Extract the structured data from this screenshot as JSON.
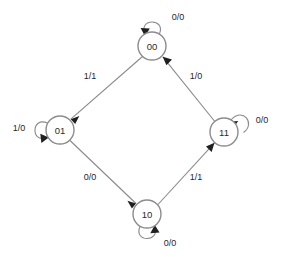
{
  "diagram": {
    "type": "finite-state-machine",
    "label_format": "input/output",
    "colors": {
      "background": "#ffffff",
      "node_stroke": "#8c8c8c",
      "node_fill": "#ffffff",
      "edge_stroke": "#8a8a8a",
      "arrow_fill": "#1f1f1f",
      "text": "#1f1f1f"
    },
    "states": [
      {
        "id": "s00",
        "label": "00",
        "cx": 152,
        "cy": 46,
        "r": 14
      },
      {
        "id": "s01",
        "label": "01",
        "cx": 60,
        "cy": 130,
        "r": 14
      },
      {
        "id": "s11",
        "label": "11",
        "cx": 224,
        "cy": 132,
        "r": 14
      },
      {
        "id": "s10",
        "label": "10",
        "cx": 147,
        "cy": 214,
        "r": 14
      }
    ],
    "self_loops": [
      {
        "id": "loop00",
        "state": "s00",
        "label": "0/0",
        "label_x": 178,
        "label_y": 17,
        "position": "top"
      },
      {
        "id": "loop01",
        "state": "s01",
        "label": "1/0",
        "label_x": 19,
        "label_y": 128,
        "position": "left"
      },
      {
        "id": "loop11",
        "state": "s11",
        "label": "0/0",
        "label_x": 262,
        "label_y": 120,
        "position": "top-right"
      },
      {
        "id": "loop10",
        "state": "s10",
        "label": "0/0",
        "label_x": 170,
        "label_y": 243,
        "position": "bottom"
      }
    ],
    "transitions": [
      {
        "id": "t1",
        "from": "s00",
        "to": "s01",
        "label": "1/1",
        "label_x": 90,
        "label_y": 76
      },
      {
        "id": "t2",
        "from": "s01",
        "to": "s10",
        "label": "0/0",
        "label_x": 90,
        "label_y": 177
      },
      {
        "id": "t3",
        "from": "s10",
        "to": "s11",
        "label": "1/1",
        "label_x": 196,
        "label_y": 177
      },
      {
        "id": "t4",
        "from": "s11",
        "to": "s00",
        "label": "1/0",
        "label_x": 196,
        "label_y": 76
      }
    ]
  }
}
